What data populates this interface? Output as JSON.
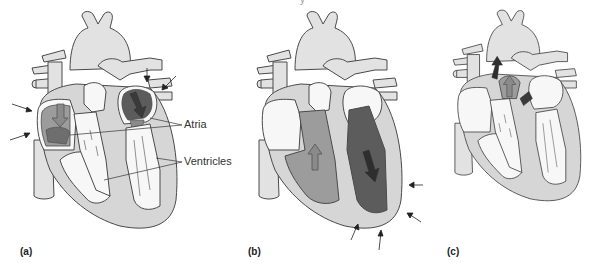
{
  "figure": {
    "top_caption_fragment": "y",
    "colors": {
      "outline": "#4a4a4a",
      "vessel_fill": "#e2e2e2",
      "myocardium_fill": "#d6d6d6",
      "chamber_white": "#f7f7f7",
      "right_blood": "#9c9c9c",
      "left_blood": "#5c5c5c",
      "arrow_light": "#8a8a8a",
      "arrow_dark": "#2e2e2e"
    },
    "panels": [
      {
        "id": "a",
        "label": "(a)",
        "description": "Atrial contraction (atria filled with blood, ventricles relaxed)"
      },
      {
        "id": "b",
        "label": "(b)",
        "description": "Ventricular contraction (ventricles filled, squeezed from outside)"
      },
      {
        "id": "c",
        "label": "(c)",
        "description": "Ejection into great arteries"
      }
    ],
    "callouts": [
      {
        "label": "Atria"
      },
      {
        "label": "Ventricles"
      }
    ]
  }
}
